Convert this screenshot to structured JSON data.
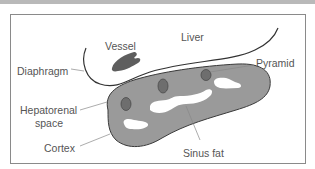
{
  "diagram": {
    "title": "",
    "labels": {
      "vessel": "Vessel",
      "liver": "Liver",
      "diaphragm": "Diaphragm",
      "pyramid": "Pyramid",
      "hepatorenal_1": "Hepatorenal",
      "hepatorenal_2": "space",
      "cortex": "Cortex",
      "sinus_fat": "Sinus fat"
    },
    "colors": {
      "kidney_fill": "#9a9a9a",
      "kidney_stroke": "#3a3a3a",
      "pyramid_fill": "#6e6e6e",
      "vessel_fill": "#5e5e5e",
      "sinus_fat": "#ffffff",
      "line": "#333333",
      "leader": "#888888",
      "frame": "#8a8a8a"
    }
  }
}
